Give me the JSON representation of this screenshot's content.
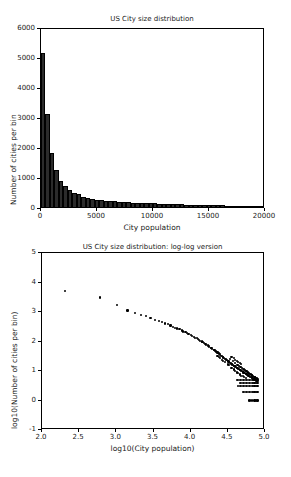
{
  "figure": {
    "width": 291,
    "height": 477,
    "background": "#ffffff",
    "foreground": "#000000"
  },
  "chart_data": [
    {
      "id": "hist",
      "type": "bar",
      "title": "US City size distribution",
      "xlabel": "City population",
      "ylabel": "Number of cities per bin",
      "xlim": [
        0,
        20000
      ],
      "ylim": [
        0,
        6000
      ],
      "xticks": [
        0,
        5000,
        10000,
        15000,
        20000
      ],
      "xticklabels": [
        "0",
        "5000",
        "10000",
        "15000",
        "20000"
      ],
      "yticks": [
        0,
        1000,
        2000,
        3000,
        4000,
        5000,
        6000
      ],
      "yticklabels": [
        "0",
        "1000",
        "2000",
        "3000",
        "4000",
        "5000",
        "6000"
      ],
      "grid": false,
      "legend": null,
      "bin_width": 400,
      "bar_color": "#2b2b2b",
      "categories": [
        200,
        600,
        1000,
        1400,
        1800,
        2200,
        2600,
        3000,
        3400,
        3800,
        4200,
        4600,
        5000,
        5400,
        5800,
        6200,
        6600,
        7000,
        7400,
        7800,
        8200,
        8600,
        9000,
        9400,
        9800,
        10200,
        10600,
        11000,
        11400,
        11800,
        12200,
        12600,
        13000,
        13400,
        13800,
        14200,
        14600,
        15000,
        15400,
        15800,
        16200,
        16600,
        17000,
        17400,
        17800,
        18200,
        18600,
        19000,
        19400,
        19800
      ],
      "values": [
        5150,
        3110,
        1800,
        1245,
        860,
        700,
        560,
        470,
        420,
        350,
        300,
        270,
        250,
        230,
        215,
        200,
        190,
        180,
        170,
        160,
        150,
        140,
        135,
        128,
        122,
        118,
        112,
        105,
        100,
        95,
        92,
        88,
        82,
        78,
        74,
        70,
        66,
        62,
        58,
        55,
        52,
        48,
        45,
        42,
        40,
        37,
        34,
        32,
        30,
        28
      ]
    },
    {
      "id": "loglog",
      "type": "scatter",
      "title": "US City size distribution: log-log version",
      "xlabel": "log10(City population)",
      "ylabel": "log10(Number of cities per bin)",
      "xlim": [
        2.0,
        5.0
      ],
      "ylim": [
        -1,
        5
      ],
      "xticks": [
        2.0,
        2.5,
        3.0,
        3.5,
        4.0,
        4.5,
        5.0
      ],
      "xticklabels": [
        "2.0",
        "2.5",
        "3.0",
        "3.5",
        "4.0",
        "4.5",
        "5.0"
      ],
      "yticks": [
        -1,
        0,
        1,
        2,
        3,
        4,
        5
      ],
      "yticklabels": [
        "-1",
        "0",
        "1",
        "2",
        "3",
        "4",
        "5"
      ],
      "grid": false,
      "legend": null,
      "marker_color": "#000000",
      "points": [
        [
          2.31,
          3.71
        ],
        [
          2.78,
          3.49
        ],
        [
          3.01,
          3.25
        ],
        [
          3.15,
          3.05
        ],
        [
          3.25,
          2.97
        ],
        [
          3.33,
          2.91
        ],
        [
          3.4,
          2.86
        ],
        [
          3.46,
          2.79
        ],
        [
          3.52,
          2.73
        ],
        [
          3.57,
          2.69
        ],
        [
          3.61,
          2.65
        ],
        [
          3.65,
          2.61
        ],
        [
          3.69,
          2.58
        ],
        [
          3.73,
          2.54
        ],
        [
          3.76,
          2.5
        ],
        [
          3.79,
          2.47
        ],
        [
          3.82,
          2.44
        ],
        [
          3.85,
          2.41
        ],
        [
          3.88,
          2.37
        ],
        [
          3.9,
          2.34
        ],
        [
          3.93,
          2.31
        ],
        [
          3.95,
          2.28
        ],
        [
          3.97,
          2.25
        ],
        [
          4.0,
          2.22
        ],
        [
          4.02,
          2.19
        ],
        [
          4.04,
          2.16
        ],
        [
          4.06,
          2.13
        ],
        [
          4.08,
          2.11
        ],
        [
          4.1,
          2.08
        ],
        [
          4.11,
          2.05
        ],
        [
          4.13,
          2.02
        ],
        [
          4.15,
          2.0
        ],
        [
          4.16,
          1.97
        ],
        [
          4.18,
          1.94
        ],
        [
          4.2,
          1.92
        ],
        [
          4.21,
          1.89
        ],
        [
          4.23,
          1.87
        ],
        [
          4.24,
          1.84
        ],
        [
          4.25,
          1.82
        ],
        [
          4.27,
          1.79
        ],
        [
          4.28,
          1.77
        ],
        [
          4.29,
          1.75
        ],
        [
          4.31,
          1.72
        ],
        [
          4.32,
          1.7
        ],
        [
          4.33,
          1.68
        ],
        [
          4.34,
          1.66
        ],
        [
          4.36,
          1.63
        ],
        [
          4.37,
          1.61
        ],
        [
          4.38,
          1.59
        ],
        [
          4.39,
          1.57
        ],
        [
          4.4,
          1.55
        ],
        [
          4.41,
          1.52
        ],
        [
          4.42,
          1.5
        ],
        [
          4.43,
          1.48
        ],
        [
          4.44,
          1.46
        ],
        [
          4.45,
          1.44
        ],
        [
          4.46,
          1.42
        ],
        [
          4.47,
          1.4
        ],
        [
          4.48,
          1.38
        ],
        [
          4.49,
          1.36
        ],
        [
          4.5,
          1.34
        ],
        [
          4.51,
          1.32
        ],
        [
          4.52,
          1.3
        ],
        [
          4.53,
          1.28
        ],
        [
          4.53,
          1.41
        ],
        [
          4.54,
          1.26
        ],
        [
          4.55,
          1.24
        ],
        [
          4.56,
          1.22
        ],
        [
          4.57,
          1.2
        ],
        [
          4.57,
          1.33
        ],
        [
          4.58,
          1.18
        ],
        [
          4.59,
          1.17
        ],
        [
          4.6,
          1.15
        ],
        [
          4.6,
          1.27
        ],
        [
          4.61,
          1.13
        ],
        [
          4.62,
          1.11
        ],
        [
          4.63,
          1.09
        ],
        [
          4.63,
          1.21
        ],
        [
          4.64,
          1.08
        ],
        [
          4.65,
          1.06
        ],
        [
          4.65,
          1.18
        ],
        [
          4.66,
          1.04
        ],
        [
          4.67,
          1.02
        ],
        [
          4.67,
          1.14
        ],
        [
          4.68,
          1.0
        ],
        [
          4.69,
          0.99
        ],
        [
          4.69,
          1.11
        ],
        [
          4.7,
          0.97
        ],
        [
          4.7,
          1.08
        ],
        [
          4.71,
          0.95
        ],
        [
          4.72,
          0.94
        ],
        [
          4.72,
          1.05
        ],
        [
          4.73,
          0.92
        ],
        [
          4.73,
          1.02
        ],
        [
          4.74,
          0.9
        ],
        [
          4.74,
          1.0
        ],
        [
          4.75,
          0.89
        ],
        [
          4.75,
          0.99
        ],
        [
          4.76,
          0.87
        ],
        [
          4.76,
          0.97
        ],
        [
          4.77,
          0.85
        ],
        [
          4.77,
          0.95
        ],
        [
          4.78,
          0.84
        ],
        [
          4.78,
          0.93
        ],
        [
          4.79,
          0.82
        ],
        [
          4.79,
          0.91
        ],
        [
          4.8,
          0.81
        ],
        [
          4.8,
          0.9
        ],
        [
          4.81,
          0.79
        ],
        [
          4.81,
          0.88
        ],
        [
          4.82,
          0.78
        ],
        [
          4.82,
          0.86
        ],
        [
          4.83,
          0.76
        ],
        [
          4.83,
          0.85
        ],
        [
          4.84,
          0.74
        ],
        [
          4.84,
          0.83
        ],
        [
          4.85,
          0.73
        ],
        [
          4.85,
          0.81
        ],
        [
          4.86,
          0.71
        ],
        [
          4.86,
          0.79
        ],
        [
          4.87,
          0.7
        ],
        [
          4.87,
          0.78
        ],
        [
          4.88,
          0.68
        ],
        [
          4.88,
          0.76
        ],
        [
          4.89,
          0.67
        ],
        [
          4.89,
          0.75
        ],
        [
          4.9,
          0.65
        ],
        [
          4.9,
          0.74
        ],
        [
          4.62,
          0.7
        ],
        [
          4.64,
          0.7
        ],
        [
          4.66,
          0.7
        ],
        [
          4.68,
          0.7
        ],
        [
          4.7,
          0.7
        ],
        [
          4.72,
          0.7
        ],
        [
          4.74,
          0.7
        ],
        [
          4.76,
          0.7
        ],
        [
          4.78,
          0.7
        ],
        [
          4.8,
          0.7
        ],
        [
          4.82,
          0.7
        ],
        [
          4.84,
          0.7
        ],
        [
          4.86,
          0.7
        ],
        [
          4.88,
          0.7
        ],
        [
          4.9,
          0.7
        ],
        [
          4.66,
          0.6
        ],
        [
          4.68,
          0.6
        ],
        [
          4.7,
          0.6
        ],
        [
          4.72,
          0.6
        ],
        [
          4.74,
          0.6
        ],
        [
          4.76,
          0.6
        ],
        [
          4.78,
          0.6
        ],
        [
          4.8,
          0.6
        ],
        [
          4.82,
          0.6
        ],
        [
          4.84,
          0.6
        ],
        [
          4.86,
          0.6
        ],
        [
          4.88,
          0.6
        ],
        [
          4.9,
          0.6
        ],
        [
          4.64,
          0.48
        ],
        [
          4.66,
          0.48
        ],
        [
          4.68,
          0.48
        ],
        [
          4.7,
          0.48
        ],
        [
          4.72,
          0.48
        ],
        [
          4.74,
          0.48
        ],
        [
          4.76,
          0.48
        ],
        [
          4.78,
          0.48
        ],
        [
          4.8,
          0.48
        ],
        [
          4.82,
          0.48
        ],
        [
          4.84,
          0.48
        ],
        [
          4.86,
          0.48
        ],
        [
          4.88,
          0.48
        ],
        [
          4.9,
          0.48
        ],
        [
          4.7,
          0.3
        ],
        [
          4.72,
          0.3
        ],
        [
          4.74,
          0.3
        ],
        [
          4.76,
          0.3
        ],
        [
          4.78,
          0.3
        ],
        [
          4.8,
          0.3
        ],
        [
          4.82,
          0.3
        ],
        [
          4.84,
          0.3
        ],
        [
          4.86,
          0.3
        ],
        [
          4.88,
          0.3
        ],
        [
          4.9,
          0.3
        ],
        [
          4.78,
          0.0
        ],
        [
          4.8,
          0.0
        ],
        [
          4.82,
          0.0
        ],
        [
          4.86,
          0.0
        ],
        [
          4.88,
          0.0
        ],
        [
          4.9,
          0.0
        ],
        [
          4.55,
          1.48
        ],
        [
          4.58,
          1.45
        ],
        [
          4.6,
          1.38
        ],
        [
          4.62,
          1.35
        ],
        [
          4.64,
          1.3
        ],
        [
          4.66,
          1.26
        ],
        [
          4.68,
          1.23
        ],
        [
          4.55,
          1.1
        ],
        [
          4.58,
          1.05
        ],
        [
          4.6,
          1.0
        ],
        [
          4.62,
          0.95
        ],
        [
          4.64,
          0.92
        ],
        [
          4.66,
          0.88
        ],
        [
          4.68,
          0.84
        ],
        [
          4.7,
          0.82
        ],
        [
          4.72,
          0.79
        ],
        [
          4.74,
          0.77
        ],
        [
          4.5,
          1.22
        ],
        [
          4.52,
          1.2
        ],
        [
          4.46,
          1.3
        ],
        [
          4.44,
          1.35
        ],
        [
          4.42,
          1.38
        ],
        [
          4.4,
          1.43
        ],
        [
          4.38,
          1.47
        ],
        [
          4.36,
          1.52
        ]
      ]
    }
  ]
}
